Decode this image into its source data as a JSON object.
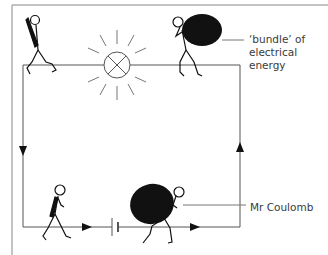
{
  "diagram": {
    "labels": {
      "bundle_line1": "‘bundle’ of",
      "bundle_line2": "electrical",
      "bundle_line3": "energy",
      "coulomb": "Mr Coulomb"
    },
    "components": [
      "lamp",
      "cell",
      "wires",
      "current-direction-arrows"
    ],
    "figures": [
      "figure-after-lamp",
      "figure-carrying-bundle-top",
      "figure-walking-empty",
      "figure-carrying-bundle-bottom"
    ],
    "colors": {
      "line": "#555555",
      "ink": "#111111",
      "text": "#3a3a3a",
      "background": "#ffffff"
    }
  }
}
